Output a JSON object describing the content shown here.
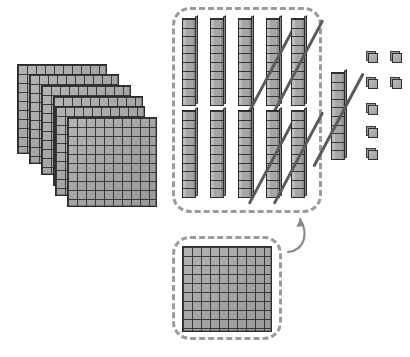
{
  "diagram": {
    "title": "Base-ten blocks regrouping",
    "type": "base-ten-blocks",
    "colors": {
      "block_fill": "#a9a9a9",
      "block_line": "#2b2b2b",
      "dashed_box": "#9b9b9b",
      "strike": "#5a5a5a",
      "arrow": "#8a8a8a",
      "background": "#ffffff"
    },
    "hundreds_stack": {
      "label": "hundreds flats stack",
      "count": 6,
      "value_each": 100,
      "total_value": 600,
      "grid_rows": 10,
      "grid_cols": 10,
      "offsets": [
        {
          "x": 17,
          "y": 64
        },
        {
          "x": 29,
          "y": 74
        },
        {
          "x": 41,
          "y": 85
        },
        {
          "x": 53,
          "y": 96
        },
        {
          "x": 55,
          "y": 106
        },
        {
          "x": 67,
          "y": 117
        }
      ]
    },
    "tens_group": {
      "label": "group of ten rods",
      "count": 10,
      "value_each": 10,
      "total_value": 100,
      "segments_per_rod": 10,
      "box": {
        "x": 172,
        "y": 7,
        "width": 150,
        "height": 206
      },
      "rows": [
        {
          "y": 18,
          "xs": [
            182,
            210,
            238,
            266,
            291
          ]
        },
        {
          "y": 110,
          "xs": [
            182,
            210,
            238,
            266,
            291
          ]
        }
      ],
      "crossed_out_indices": [
        3,
        4
      ]
    },
    "tens_loose": {
      "label": "loose ten rod",
      "count": 1,
      "value_each": 10,
      "total_value": 10,
      "segments_per_rod": 10,
      "position": {
        "x": 331,
        "y": 72
      },
      "crossed_out": true
    },
    "ones_group": {
      "label": "unit cubes",
      "count": 6,
      "value_each": 1,
      "total_value": 6,
      "positions": [
        {
          "x": 368,
          "y": 53
        },
        {
          "x": 392,
          "y": 53
        },
        {
          "x": 368,
          "y": 79
        },
        {
          "x": 392,
          "y": 79
        },
        {
          "x": 368,
          "y": 105
        },
        {
          "x": 368,
          "y": 128
        },
        {
          "x": 368,
          "y": 150
        }
      ]
    },
    "regrouped_flat": {
      "label": "regrouped hundred flat",
      "count": 1,
      "value_each": 100,
      "total_value": 100,
      "grid_rows": 10,
      "grid_cols": 10,
      "box": {
        "x": 172,
        "y": 236,
        "width": 110,
        "height": 104
      },
      "flat_position": {
        "x": 182,
        "y": 246
      }
    },
    "arrow": {
      "label": "regroup arrow",
      "from": "regrouped-flat-box",
      "to": "tens-group-box",
      "direction": "up-left"
    }
  }
}
